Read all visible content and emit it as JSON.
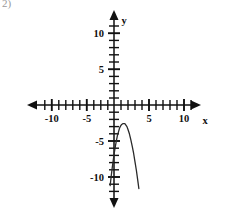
{
  "problem": {
    "number_label": "2)"
  },
  "figure": {
    "axis_color": "#111111",
    "curve_color": "#2a2a2a",
    "background_color": "#ffffff"
  },
  "chart_data": {
    "type": "line",
    "title": "",
    "subtitle": "",
    "xlabel": "x",
    "ylabel": "y",
    "xlim": [
      -12,
      12
    ],
    "ylim": [
      -12,
      12
    ],
    "grid": false,
    "legend": null,
    "x_axis": {
      "label": "x",
      "tick_interval": 1,
      "labeled_ticks": [
        {
          "value": -10,
          "text": "-10"
        },
        {
          "value": -5,
          "text": "-5"
        },
        {
          "value": 5,
          "text": "5"
        },
        {
          "value": 10,
          "text": "10"
        }
      ],
      "minor_ticks": [
        -11,
        -9,
        -8,
        -7,
        -6,
        -4,
        -3,
        -2,
        -1,
        1,
        2,
        3,
        4,
        6,
        7,
        8,
        9,
        11
      ],
      "arrows": [
        "left",
        "right"
      ]
    },
    "y_axis": {
      "label": "y",
      "tick_interval": 1,
      "labeled_ticks": [
        {
          "value": 10,
          "text": "10"
        },
        {
          "value": 5,
          "text": "5"
        },
        {
          "value": -5,
          "text": "-5"
        },
        {
          "value": -10,
          "text": "-10"
        }
      ],
      "minor_ticks": [
        11,
        9,
        8,
        7,
        6,
        4,
        3,
        2,
        1,
        -1,
        -2,
        -3,
        -4,
        -6,
        -7,
        -8,
        -9,
        -11
      ],
      "arrows": [
        "up",
        "down"
      ]
    },
    "series": [
      {
        "name": "parabola",
        "shape": "downward-opening parabola",
        "vertex": [
          1.4,
          -2.6
        ],
        "points": [
          [
            -0.55,
            -11.2
          ],
          [
            -0.4,
            -9.9
          ],
          [
            -0.25,
            -8.7
          ],
          [
            -0.1,
            -7.6
          ],
          [
            0.05,
            -6.6
          ],
          [
            0.2,
            -5.7
          ],
          [
            0.35,
            -4.9
          ],
          [
            0.5,
            -4.2
          ],
          [
            0.65,
            -3.7
          ],
          [
            0.8,
            -3.2
          ],
          [
            0.95,
            -2.9
          ],
          [
            1.1,
            -2.7
          ],
          [
            1.25,
            -2.6
          ],
          [
            1.4,
            -2.6
          ],
          [
            1.55,
            -2.6
          ],
          [
            1.7,
            -2.8
          ],
          [
            1.85,
            -3.0
          ],
          [
            2.0,
            -3.4
          ],
          [
            2.2,
            -4.0
          ],
          [
            2.4,
            -4.8
          ],
          [
            2.6,
            -5.7
          ],
          [
            2.8,
            -6.7
          ],
          [
            3.0,
            -7.9
          ],
          [
            3.2,
            -9.1
          ],
          [
            3.4,
            -10.5
          ],
          [
            3.55,
            -11.6
          ]
        ]
      }
    ]
  }
}
